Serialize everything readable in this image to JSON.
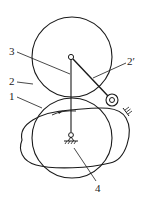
{
  "diagram": {
    "type": "cam mechanism with oscillating roller follower",
    "labels": {
      "l1": "1",
      "l2": "2",
      "l2p": "2′",
      "l3": "3",
      "l4": "4"
    },
    "parts": [
      {
        "id": "1",
        "name": "cam (egg-shaped profile)"
      },
      {
        "id": "2",
        "name": "pitch circle (large circle, upper)"
      },
      {
        "id": "2p",
        "name": "roller follower"
      },
      {
        "id": "3",
        "name": "follower arm / center line"
      },
      {
        "id": "4",
        "name": "fixed pivot (frame)"
      }
    ],
    "colors": {
      "stroke": "#1a1a1a",
      "background": "#ffffff"
    }
  }
}
